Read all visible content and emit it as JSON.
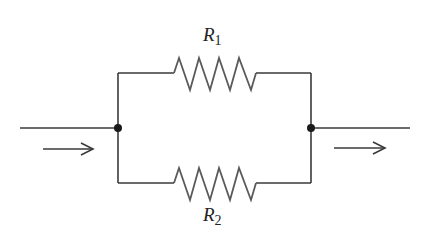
{
  "diagram": {
    "type": "parallel-resistor-circuit",
    "resistors": [
      {
        "name": "R",
        "subscript": "1",
        "branch": "top"
      },
      {
        "name": "R",
        "subscript": "2",
        "branch": "bottom"
      }
    ],
    "nodes": [
      "left-junction",
      "right-junction"
    ],
    "current_arrows": [
      {
        "position": "input",
        "direction": "right"
      },
      {
        "position": "output",
        "direction": "right"
      }
    ],
    "colors": {
      "wire": "#3a3a3a",
      "resistor": "#5a5a5a",
      "node": "#1a1a1a",
      "background": "#ffffff"
    }
  }
}
